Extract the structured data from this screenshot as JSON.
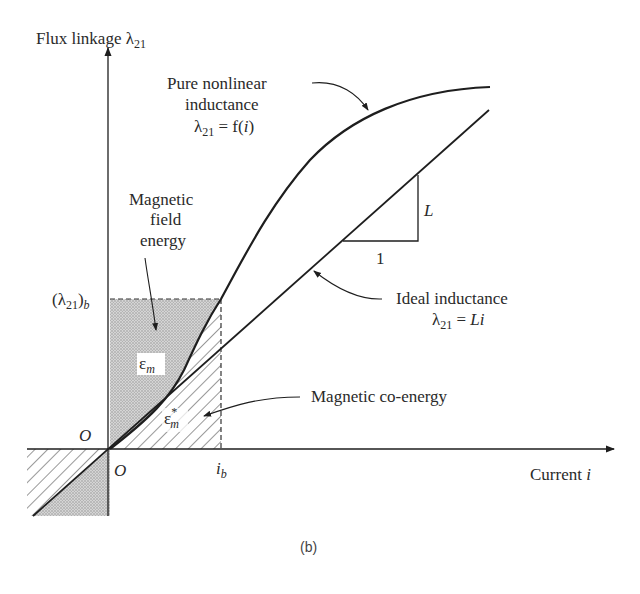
{
  "figure": {
    "caption": "(b)",
    "y_axis": {
      "label": "Flux linkage λ",
      "subscript": "21"
    },
    "x_axis": {
      "label": "Current ",
      "variable": "i"
    },
    "origin_labels": {
      "y_origin": "O",
      "x_origin": "O"
    },
    "ticks": {
      "lambda_b": {
        "open": "(λ",
        "sub1": "21",
        "close": ")",
        "sub2": "b"
      },
      "i_b": {
        "var": "i",
        "sub": "b"
      }
    },
    "annotations": {
      "nonlinear": {
        "line1": "Pure nonlinear",
        "line2": "inductance",
        "eq_lambda": "λ",
        "eq_sub": "21",
        "eq_rest": " = f(",
        "eq_var": "i",
        "eq_close": ")"
      },
      "ideal": {
        "line1": "Ideal inductance",
        "eq_lambda": "λ",
        "eq_sub": "21",
        "eq_rest": " = ",
        "eq_var": "Li"
      },
      "field_energy": {
        "line1": "Magnetic",
        "line2": "field",
        "line3": "energy"
      },
      "co_energy": {
        "text": "Magnetic co-energy"
      },
      "slope": {
        "rise": "L",
        "run": "1"
      },
      "energy_symbol": {
        "symbol": "ε",
        "sub": "m"
      },
      "coenergy_symbol": {
        "symbol": "ε",
        "sup": "*",
        "sub": "m"
      }
    },
    "colors": {
      "ink": "#1e1e1e",
      "stipple": "#b9b9b9",
      "background": "#ffffff"
    }
  }
}
